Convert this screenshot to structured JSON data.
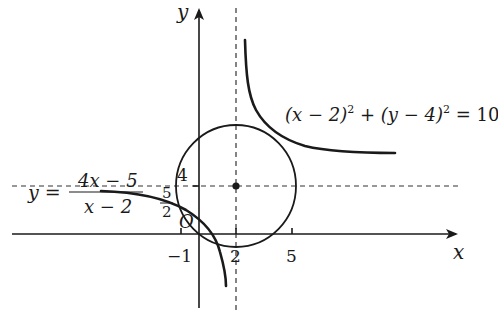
{
  "diagram": {
    "type": "coordinate-sketch",
    "axes": {
      "x_label": "x",
      "y_label": "y",
      "origin_label": "O"
    },
    "ticks": {
      "x": [
        {
          "value": -1,
          "label": "−1"
        },
        {
          "value": 2,
          "label": "2"
        },
        {
          "value": 5,
          "label": "5"
        }
      ],
      "y": [
        {
          "value": 4,
          "label": "4"
        },
        {
          "value": 2.5,
          "label_num": "5",
          "label_den": "2"
        }
      ]
    },
    "asymptotes": {
      "vertical": "x = 2",
      "horizontal": "y = 4"
    },
    "center_point": {
      "x": 2,
      "y": 4
    },
    "hyperbola": {
      "lhs": "y =",
      "numerator": "4x − 5",
      "denominator": "x − 2"
    },
    "circle": {
      "equation_parts": [
        "(x − 2)",
        "2",
        " + (y − 4)",
        "2",
        " = 10"
      ],
      "center": [
        2,
        4
      ],
      "radius_squared": 10
    },
    "colors": {
      "ink": "#1a1a1a",
      "background": "#ffffff"
    }
  }
}
